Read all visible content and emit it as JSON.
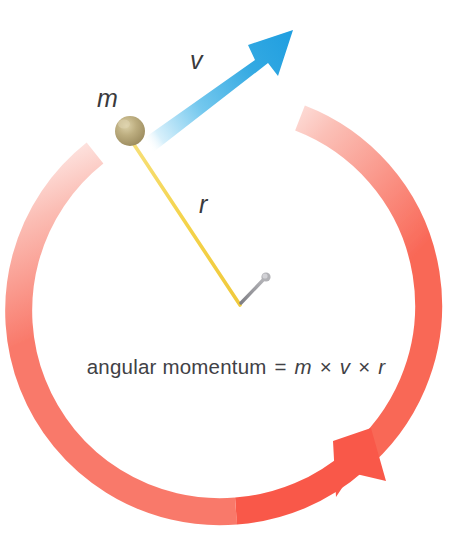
{
  "figure": {
    "type": "physics-diagram",
    "background_color": "#ffffff"
  },
  "labels": {
    "mass": "m",
    "velocity": "v",
    "radius": "r"
  },
  "equation": {
    "full_text": "angular momentum = m × v × r",
    "left_side": "angular momentum",
    "equals": "=",
    "term1": "m",
    "times1": "×",
    "term2": "v",
    "times2": "×",
    "term3": "r"
  },
  "elements": {
    "rotation_ring": {
      "name": "rotation-direction-arrow",
      "color": "#f9594a",
      "faded_color": "#ffffff",
      "direction": "counterclockwise",
      "center": {
        "x": 236,
        "y": 310
      },
      "radius": 201,
      "stroke_width": 27
    },
    "velocity_arrow": {
      "name": "velocity-vector-arrow",
      "color": "#1f9fe0",
      "faded_color": "#d9f1fb",
      "from": {
        "x": 146,
        "y": 129
      },
      "to": {
        "x": 293,
        "y": 30
      }
    },
    "string": {
      "name": "string",
      "color": "#f2d23f",
      "from": {
        "x": 131,
        "y": 140
      },
      "to": {
        "x": 240,
        "y": 305
      }
    },
    "ball": {
      "name": "mass-ball",
      "color": "#b3a375",
      "highlight_color": "#d8cb9e",
      "center": {
        "x": 130,
        "y": 131
      },
      "radius": 15
    },
    "nail": {
      "name": "nail-pivot",
      "color": "#8d8d91",
      "head": {
        "x": 266,
        "y": 277
      },
      "point": {
        "x": 240,
        "y": 304
      }
    }
  }
}
